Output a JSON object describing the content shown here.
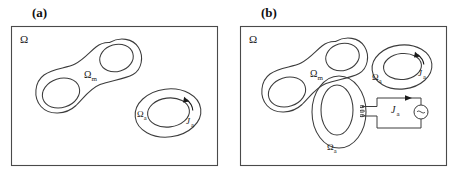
{
  "figure": {
    "type": "diagram",
    "panels": [
      {
        "id": "a",
        "label": "(a)",
        "domain_label": "Ω",
        "regions": [
          {
            "name": "magnetic-region",
            "label": "Ω",
            "subscript": "m",
            "shape": "dumbbell-two-holes"
          },
          {
            "name": "conductor-region",
            "label": "Ω",
            "subscript": "a",
            "shape": "torus"
          }
        ],
        "current_labels": [
          {
            "name": "source-current",
            "label": "J",
            "subscript": "a"
          }
        ]
      },
      {
        "id": "b",
        "label": "(b)",
        "domain_label": "Ω",
        "regions": [
          {
            "name": "magnetic-region",
            "label": "Ω",
            "subscript": "m",
            "shape": "dumbbell-two-holes"
          },
          {
            "name": "conductor-region-upper",
            "label": "Ω",
            "subscript": "a",
            "shape": "torus"
          },
          {
            "name": "conductor-region-lower",
            "label": "Ω",
            "subscript": "a",
            "shape": "torus-with-winding"
          }
        ],
        "current_labels": [
          {
            "name": "coil-current-upper",
            "label": "J",
            "subscript": "a"
          },
          {
            "name": "circuit-current",
            "label": "J",
            "subscript": "a"
          }
        ],
        "circuit": {
          "name": "external-circuit",
          "current_label": "J",
          "current_subscript": "a",
          "source_symbol": "generator"
        }
      }
    ],
    "colors": {
      "stroke": "#3c3c3c",
      "box_stroke": "#4a4a4a",
      "text": "#1a1a1a",
      "background": "#ffffff"
    }
  }
}
